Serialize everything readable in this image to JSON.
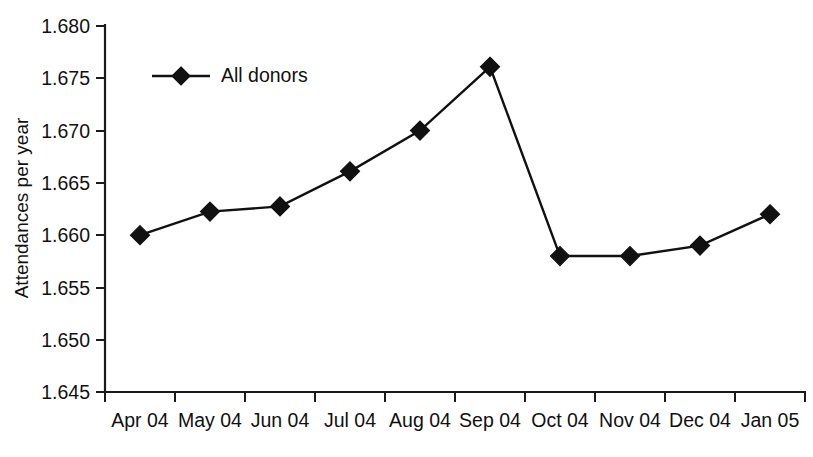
{
  "chart_data": {
    "type": "line",
    "title": "",
    "subtitle": "",
    "xlabel": "",
    "ylabel": "Attendances per year",
    "categories": [
      "Apr 04",
      "May 04",
      "Jun 04",
      "Jul 04",
      "Aug 04",
      "Sep 04",
      "Oct 04",
      "Nov 04",
      "Dec 04",
      "Jan 05"
    ],
    "ylim": [
      1.645,
      1.68
    ],
    "yticks": [
      1.645,
      1.65,
      1.655,
      1.66,
      1.665,
      1.67,
      1.675,
      1.68
    ],
    "ytick_labels": [
      "1.645",
      "1.650",
      "1.655",
      "1.660",
      "1.665",
      "1.670",
      "1.675",
      "1.680"
    ],
    "grid": false,
    "legend_position": "top-left",
    "marker": "diamond",
    "series": [
      {
        "name": "All donors",
        "color": "#111111",
        "values": [
          1.66,
          1.66225,
          1.66275,
          1.6661,
          1.67,
          1.6761,
          1.658,
          1.658,
          1.659,
          1.662
        ]
      }
    ],
    "annotations": []
  },
  "legend": {
    "items": [
      {
        "label": "All donors",
        "marker": "diamond-marker-icon",
        "color": "#111111"
      }
    ]
  },
  "axes": {
    "y_axis_title": "Attendances per year",
    "x_axis_title": ""
  },
  "colors": {
    "background": "#ffffff",
    "axis": "#1a1a1a",
    "series": "#111111",
    "text": "#111111"
  }
}
